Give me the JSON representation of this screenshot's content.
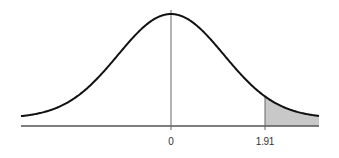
{
  "chart_data": {
    "type": "area",
    "title": "",
    "subtitle": "",
    "xlabel": "",
    "ylabel": "",
    "distribution": "standard normal",
    "mean": 0,
    "std_dev": 1,
    "x_ticks": [
      {
        "value": 0,
        "label": "0"
      },
      {
        "value": 1.91,
        "label": "1.91"
      }
    ],
    "shaded_region": {
      "from": 1.91,
      "to": "infinity",
      "side": "right tail",
      "color": "#c8c8c8"
    },
    "vertical_lines": [
      0,
      1.91
    ],
    "xlim": [
      -2.8,
      2.8
    ],
    "grid": false,
    "legend": null,
    "colors": {
      "curve": "#111111",
      "axis": "#555555",
      "shade": "#c8c8c8"
    }
  },
  "labels": {
    "tick_zero": "0",
    "tick_critical": "1.91"
  }
}
